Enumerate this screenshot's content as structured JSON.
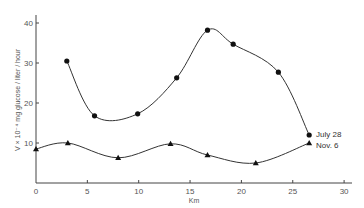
{
  "chart_data": {
    "type": "line",
    "title": "",
    "xlabel": "Km",
    "ylabel": "V × 10⁻⁴ mg glucose / liter / hour",
    "xlim": [
      0,
      30
    ],
    "ylim": [
      0,
      40
    ],
    "xticks": [
      0,
      5,
      10,
      15,
      20,
      25,
      30
    ],
    "yticks": [
      10,
      20,
      30,
      40
    ],
    "grid": false,
    "legend_position": "inline-right",
    "series": [
      {
        "name": "July 28",
        "marker": "circle",
        "x": [
          3.0,
          5.7,
          9.9,
          13.7,
          16.7,
          19.2,
          23.6,
          26.6
        ],
        "values": [
          30.5,
          16.8,
          17.3,
          26.3,
          38.2,
          34.7,
          27.7,
          12.0
        ]
      },
      {
        "name": "Nov. 6",
        "marker": "triangle",
        "x": [
          0,
          3.1,
          8.0,
          13.1,
          16.7,
          21.4,
          26.6
        ],
        "values": [
          8.5,
          10.0,
          6.3,
          9.8,
          7.0,
          5.0,
          10.0
        ]
      }
    ]
  },
  "axes": {
    "x_tick_labels": [
      "0",
      "5",
      "10",
      "15",
      "20",
      "25",
      "30"
    ],
    "y_tick_labels": [
      "10",
      "20",
      "30",
      "40"
    ],
    "x_label": "Km",
    "y_label": "V × 10⁻⁴ mg glucose / liter / hour"
  },
  "legend": {
    "july": "July 28",
    "nov": "Nov. 6"
  }
}
